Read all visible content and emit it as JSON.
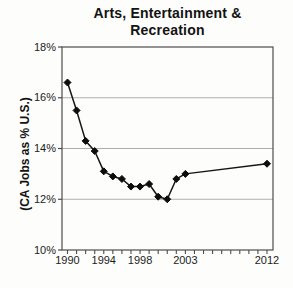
{
  "page": {
    "background": "#fdfdfb"
  },
  "chart_data": {
    "type": "line",
    "title": "Arts, Entertainment & Recreation",
    "title_lines": [
      "Arts, Entertainment &",
      "Recreation"
    ],
    "ylabel": "(CA Jobs as % U.S.)",
    "xlabel": "",
    "x": [
      1990,
      1991,
      1992,
      1993,
      1994,
      1995,
      1996,
      1997,
      1998,
      1999,
      2000,
      2001,
      2002,
      2003,
      2012
    ],
    "values": [
      16.6,
      15.5,
      14.3,
      13.9,
      13.1,
      12.9,
      12.8,
      12.5,
      12.5,
      12.6,
      12.1,
      12.0,
      12.8,
      13.0,
      13.4
    ],
    "series": [
      {
        "name": "CA jobs as percent of U.S.",
        "values": [
          16.6,
          15.5,
          14.3,
          13.9,
          13.1,
          12.9,
          12.8,
          12.5,
          12.5,
          12.6,
          12.1,
          12.0,
          12.8,
          13.0,
          13.4
        ]
      }
    ],
    "ylim": [
      10,
      18
    ],
    "xlim": [
      1989.4,
      2012.7
    ],
    "yticks": [
      {
        "label": "18%",
        "value": 18
      },
      {
        "label": "16%",
        "value": 16
      },
      {
        "label": "14%",
        "value": 14
      },
      {
        "label": "12%",
        "value": 12
      },
      {
        "label": "10%",
        "value": 10
      }
    ],
    "xticks": [
      {
        "label": "1990",
        "value": 1990
      },
      {
        "label": "1994",
        "value": 1994
      },
      {
        "label": "1998",
        "value": 1998
      },
      {
        "label": "2003",
        "value": 2003
      },
      {
        "label": "2012",
        "value": 2012
      }
    ],
    "xtick_minor": {
      "from": 1990,
      "to": 2012,
      "step": 1
    },
    "grid": "horizontal",
    "legend": "none",
    "marker": "diamond",
    "colors": {
      "line": "#151515",
      "marker": "#0d0d0d",
      "gridline": "#aeaeae",
      "axis": "#4d4d4d",
      "text": "#1a1a1a"
    }
  }
}
